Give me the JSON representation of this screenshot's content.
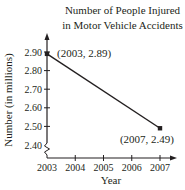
{
  "chart_data": {
    "type": "line",
    "title": "Number of People Injured in Motor Vehicle Accidents",
    "title_lines": [
      "Number of People Injured",
      "in Motor Vehicle Accidents"
    ],
    "xlabel": "Year",
    "ylabel": "Number (in millions)",
    "x": [
      2003,
      2007
    ],
    "series": [
      {
        "name": "Injured",
        "values": [
          2.89,
          2.49
        ]
      }
    ],
    "x_ticks": [
      "2003",
      "2004",
      "2005",
      "2006",
      "2007"
    ],
    "y_ticks": [
      "2.40",
      "2.50",
      "2.60",
      "2.70",
      "2.80",
      "2.90"
    ],
    "ylim": [
      2.4,
      2.9
    ],
    "xlim": [
      2003,
      2007
    ],
    "grid": false,
    "legend": "none",
    "annotations": [
      {
        "text": "(2003, 2.89)",
        "x": 2003,
        "y": 2.89
      },
      {
        "text": "(2007, 2.49)",
        "x": 2007,
        "y": 2.49
      }
    ],
    "y_axis_break": true
  },
  "colors": {
    "line": "#231f20",
    "background": "#ffffff"
  }
}
